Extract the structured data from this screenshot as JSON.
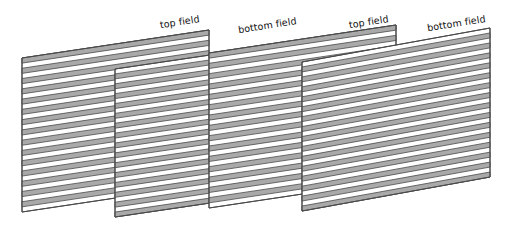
{
  "figure": {
    "background_color": "#ffffff",
    "panel_fill_color": "#ffffff",
    "stripe_fill_color": "#a9a9a9",
    "stroke_color": "#4a4a4a",
    "label_color": "#111111",
    "label_rotation_deg": -9,
    "panel_count": 4,
    "stripe_pairs_per_panel": 15
  },
  "labels": [
    {
      "id": "label-1",
      "text": "top field",
      "x": 200,
      "y": 22,
      "anchor": "end"
    },
    {
      "id": "label-2",
      "text": "bottom field",
      "x": 297,
      "y": 24,
      "anchor": "end"
    },
    {
      "id": "label-3",
      "text": "top field",
      "x": 389,
      "y": 22,
      "anchor": "end"
    },
    {
      "id": "label-4",
      "text": "bottom field",
      "x": 486,
      "y": 22,
      "anchor": "end"
    }
  ],
  "panels": [
    {
      "id": "panel-1",
      "field": "top field",
      "phase": "gray-first",
      "x_left": 22,
      "x_right": 209,
      "y_top_left": 58,
      "y_top_right": 30,
      "y_bot_left": 212,
      "y_bot_right": 184
    },
    {
      "id": "panel-2",
      "field": "bottom field",
      "phase": "white-first",
      "x_left": 115,
      "x_right": 305,
      "y_top_left": 69,
      "y_top_right": 41,
      "y_bot_left": 217,
      "y_bot_right": 189
    },
    {
      "id": "panel-3",
      "field": "top field",
      "phase": "gray-first",
      "x_left": 209,
      "x_right": 396,
      "y_top_left": 53,
      "y_top_right": 25,
      "y_bot_left": 208,
      "y_bot_right": 180
    },
    {
      "id": "panel-4",
      "field": "bottom field",
      "phase": "white-first",
      "x_left": 302,
      "x_right": 490,
      "y_top_left": 62,
      "y_top_right": 28,
      "y_bot_left": 211,
      "y_bot_right": 177
    }
  ]
}
